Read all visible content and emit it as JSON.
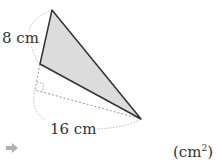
{
  "figure": {
    "labels": {
      "side_a": "8 cm",
      "side_b": "16 cm"
    },
    "vertices": {
      "top": [
        52,
        10
      ],
      "middle": [
        40,
        64
      ],
      "bottom_right": [
        141,
        119
      ],
      "right_angle": [
        35,
        90
      ]
    },
    "colors": {
      "fill": "#dcdcdc",
      "stroke": "#333333",
      "dashed": "#999999",
      "arrow": "#b0b0b0"
    }
  },
  "answer": {
    "unit": "(cm",
    "unit_exp": "2",
    "unit_close": ")"
  }
}
